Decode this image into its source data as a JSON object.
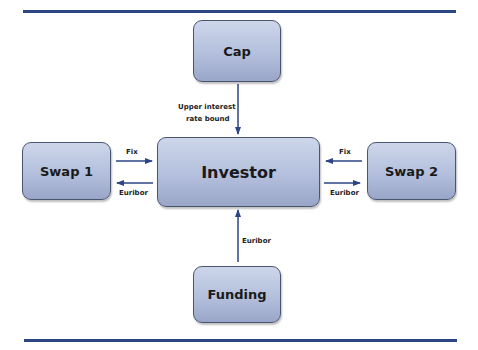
{
  "diagram": {
    "nodes": {
      "cap": "Cap",
      "investor": "Investor",
      "swap1": "Swap 1",
      "swap2": "Swap 2",
      "funding": "Funding"
    },
    "edges": {
      "cap_to_investor": "Upper interest rate bound",
      "cap_label_line1": "Upper interest",
      "cap_label_line2": "rate bound",
      "swap1_to_investor": "Fix",
      "investor_to_swap1": "Euribor",
      "swap2_to_investor": "Fix",
      "investor_to_swap2": "Euribor",
      "funding_to_investor": "Euribor"
    },
    "colors": {
      "rule": "#2b4585",
      "arrow": "#2b4585",
      "box_top": "#cdd6ea",
      "box_bottom": "#9aa6c8"
    }
  }
}
